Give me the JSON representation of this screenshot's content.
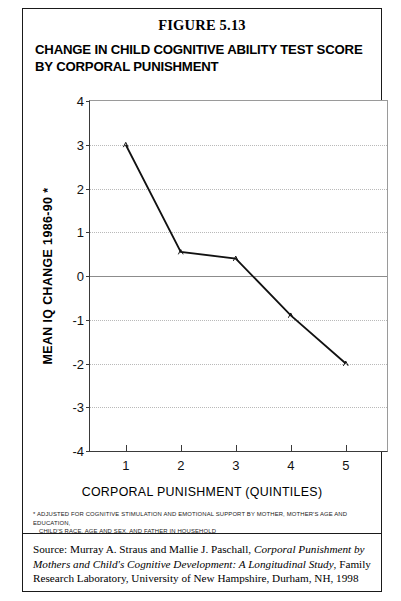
{
  "figure": {
    "number": "FIGURE 5.13",
    "title_line1": "CHANGE IN CHILD COGNITIVE ABILITY TEST SCORE",
    "title_line2": "BY CORPORAL PUNISHMENT"
  },
  "footnote": {
    "line1": "* ADJUSTED FOR COGNITIVE STIMULATION AND EMOTIONAL SUPPORT BY MOTHER, MOTHER'S AGE AND EDUCATION,",
    "line2": "CHILD'S RACE, AGE AND SEX, AND FATHER IN HOUSEHOLD"
  },
  "source": {
    "prefix": "Source: Murray A. Straus and Mallie J. Paschall, ",
    "italic": "Corporal Punishment by Mothers and Child's Cognitive Development: A Longitudinal Study",
    "suffix": ", Family Research Laboratory, University of New Hampshire, Durham, NH, 1998"
  },
  "colors": {
    "line": "#111111",
    "gridline": "#b9b9b9",
    "zeroline": "#8c8c8c",
    "axis": "#3a3a3a"
  },
  "chart_data": {
    "type": "line",
    "title": "CHANGE IN CHILD COGNITIVE ABILITY TEST SCORE BY CORPORAL PUNISHMENT",
    "xlabel": "CORPORAL PUNISHMENT (QUINTILES)",
    "ylabel": "MEAN IQ CHANGE 1986-90 *",
    "categories": [
      "1",
      "2",
      "3",
      "4",
      "5"
    ],
    "x": [
      1,
      2,
      3,
      4,
      5
    ],
    "values": [
      3.0,
      0.55,
      0.4,
      -0.9,
      -2.0
    ],
    "ylim": [
      -4,
      4
    ],
    "xlim": [
      0.35,
      5.75
    ],
    "yticks": [
      4,
      3,
      2,
      1,
      0,
      -1,
      -2,
      -3,
      -4
    ],
    "ytick_labels": [
      "4",
      "3",
      "2",
      "1",
      "0",
      "-1",
      "-2",
      "-3",
      "-4"
    ],
    "xticks": [
      1,
      2,
      3,
      4,
      5
    ],
    "xtick_labels": [
      "1",
      "2",
      "3",
      "4",
      "5"
    ],
    "grid": true,
    "grid_style": "dotted-horizontal",
    "zero_line": true,
    "legend": false,
    "markers": true
  }
}
